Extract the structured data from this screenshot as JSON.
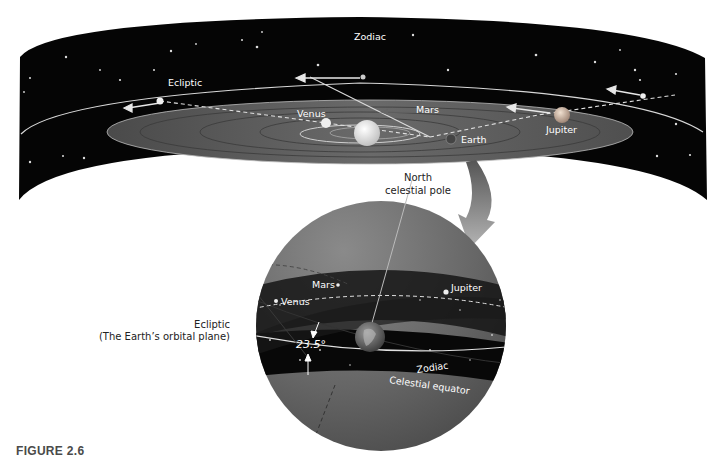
{
  "figure": {
    "caption": "FIGURE 2.6"
  },
  "top_panel": {
    "labels": {
      "zodiac": "Zodiac",
      "ecliptic": "Ecliptic",
      "venus": "Venus",
      "mars": "Mars",
      "earth": "Earth",
      "jupiter": "Jupiter"
    }
  },
  "sphere_panel": {
    "labels": {
      "north_pole_line1": "North",
      "north_pole_line2": "celestial pole",
      "mars": "Mars",
      "jupiter": "Jupiter",
      "venus": "Venus",
      "ecliptic_line1": "Ecliptic",
      "ecliptic_line2": "(The Earth’s orbital plane)",
      "tilt_angle": "23.5°",
      "zodiac": "Zodiac",
      "celestial_equator": "Celestial equator"
    }
  },
  "colors": {
    "space": "#050505",
    "orbital_plane": "#5e5e5e",
    "sphere": "#6a6a6a",
    "sun": "#e8e8e8",
    "arrow": "#9a9a9a"
  }
}
